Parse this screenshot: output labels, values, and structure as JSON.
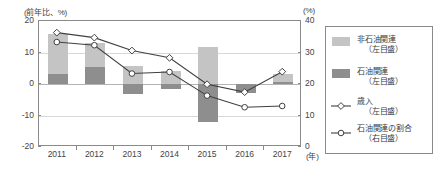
{
  "chart_data": {
    "type": "bar",
    "title": "",
    "subtitle": "",
    "xlabel": "(年)",
    "ylabel": "(前年比、%)",
    "y2label": "(%)",
    "categories": [
      "2011",
      "2012",
      "2013",
      "2014",
      "2015",
      "2016",
      "2017"
    ],
    "ylim": [
      -20,
      20
    ],
    "yticks": [
      "20",
      "10",
      "0",
      "-10",
      "-20"
    ],
    "ytick_values": [
      20,
      10,
      0,
      -10,
      -20
    ],
    "y2lim": [
      0,
      40
    ],
    "y2ticks": [
      "40",
      "30",
      "20",
      "10",
      "0"
    ],
    "y2tick_values": [
      40,
      30,
      20,
      10,
      0
    ],
    "grid": true,
    "legend_position": "right-outside",
    "series": [
      {
        "name": "非石油関連（左目盛）",
        "label_main": "非石油関連",
        "label_sub": "（左目盛）",
        "type": "bar",
        "axis": "left",
        "color": "#c4c4c4",
        "values": [
          12.6,
          7.6,
          5.6,
          4.2,
          11.6,
          0.0,
          2.4
        ]
      },
      {
        "name": "石油関連（左目盛）",
        "label_main": "石油関連",
        "label_sub": "（左目盛）",
        "type": "bar",
        "axis": "left",
        "color": "#8e8e8e",
        "values": [
          3.4,
          5.4,
          -3.2,
          -1.6,
          -12.2,
          -2.9,
          0.9
        ]
      },
      {
        "name": "歳入（左目盛）",
        "label_main": "歳入",
        "label_sub": "（左目盛）",
        "type": "line",
        "axis": "left",
        "marker": "diamond",
        "color": "#404040",
        "values": [
          16.0,
          14.4,
          10.3,
          8.0,
          -0.4,
          -2.9,
          3.6
        ]
      },
      {
        "name": "石油関連の割合（右目盛）",
        "label_main": "石油関連の割合",
        "label_sub": "（右目盛）",
        "type": "line",
        "axis": "right",
        "marker": "circle",
        "color": "#404040",
        "values": [
          33.0,
          32.0,
          23.0,
          23.5,
          16.0,
          12.3,
          12.7
        ]
      }
    ]
  }
}
